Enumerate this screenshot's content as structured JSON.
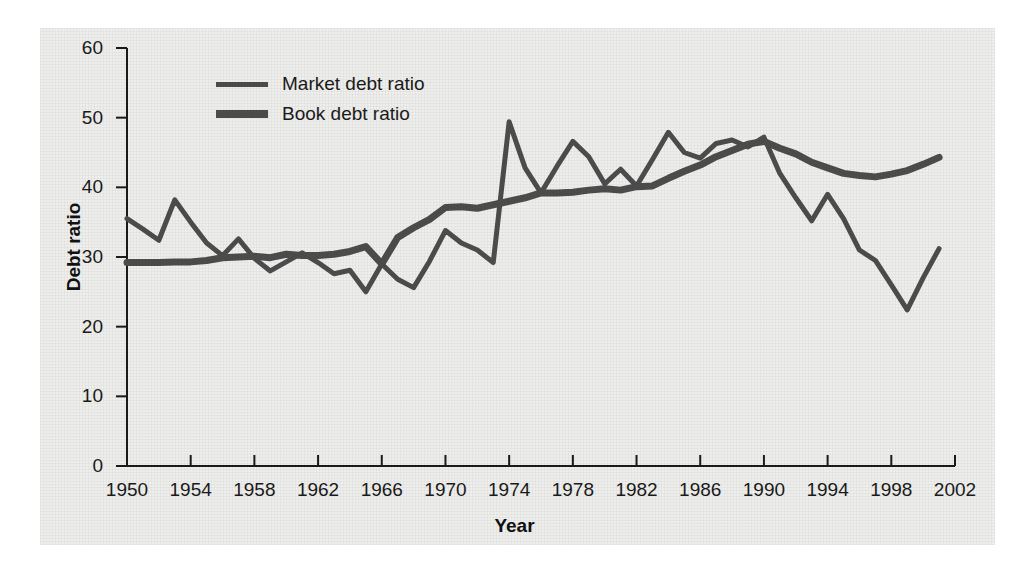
{
  "chart_data": {
    "type": "line",
    "title": "",
    "xlabel": "Year",
    "ylabel": "Debt ratio",
    "xlim": [
      1950,
      2002
    ],
    "ylim": [
      0,
      60
    ],
    "yticks": [
      0,
      10,
      20,
      30,
      40,
      50,
      60
    ],
    "xticks": [
      1950,
      1954,
      1958,
      1962,
      1966,
      1970,
      1974,
      1978,
      1982,
      1986,
      1990,
      1994,
      1998,
      2002
    ],
    "grid": false,
    "legend_position": "upper-left-inside",
    "line_color": "#4b4b4b",
    "panel_color": "#eeeeec",
    "x": [
      1950,
      1951,
      1952,
      1953,
      1954,
      1955,
      1956,
      1957,
      1958,
      1959,
      1960,
      1961,
      1962,
      1963,
      1964,
      1965,
      1966,
      1967,
      1968,
      1969,
      1970,
      1971,
      1972,
      1973,
      1974,
      1975,
      1976,
      1977,
      1978,
      1979,
      1980,
      1981,
      1982,
      1983,
      1984,
      1985,
      1986,
      1987,
      1988,
      1989,
      1990,
      1991,
      1992,
      1993,
      1994,
      1995,
      1996,
      1997,
      1998,
      1999,
      2000,
      2001
    ],
    "series": [
      {
        "name": "Market debt ratio",
        "style": "thin",
        "values": [
          35.5,
          34.0,
          32.4,
          38.2,
          35.0,
          32.0,
          30.2,
          32.6,
          29.8,
          28.0,
          29.3,
          30.6,
          29.2,
          27.6,
          28.1,
          25.0,
          29.0,
          26.8,
          25.6,
          29.4,
          33.8,
          32.0,
          31.0,
          29.2,
          49.4,
          42.8,
          39.2,
          43.0,
          46.6,
          44.4,
          40.5,
          42.6,
          40.2,
          44.0,
          47.9,
          45.0,
          44.2,
          46.3,
          46.8,
          45.8,
          47.2,
          42.0,
          38.5,
          35.2,
          39.0,
          35.5,
          31.0,
          29.5,
          26.0,
          22.4,
          27.0,
          31.2
        ]
      },
      {
        "name": "Book debt ratio",
        "style": "thick",
        "values": [
          29.2,
          29.2,
          29.2,
          29.3,
          29.3,
          29.5,
          29.9,
          30.0,
          30.1,
          29.9,
          30.4,
          30.2,
          30.2,
          30.4,
          30.8,
          31.5,
          29.0,
          32.8,
          34.2,
          35.4,
          37.1,
          37.2,
          37.0,
          37.5,
          38.0,
          38.5,
          39.2,
          39.2,
          39.3,
          39.6,
          39.8,
          39.6,
          40.1,
          40.2,
          41.3,
          42.3,
          43.2,
          44.4,
          45.3,
          46.2,
          46.6,
          45.6,
          44.8,
          43.6,
          42.8,
          42.0,
          41.7,
          41.5,
          41.9,
          42.4,
          43.3,
          44.3
        ]
      }
    ]
  },
  "axes": {
    "y_tick_labels": [
      "60",
      "50",
      "40",
      "30",
      "20",
      "10",
      "0"
    ],
    "x_tick_labels": [
      "1950",
      "1954",
      "1958",
      "1962",
      "1966",
      "1970",
      "1974",
      "1978",
      "1982",
      "1986",
      "1990",
      "1994",
      "1998",
      "2002"
    ],
    "y_axis_title": "Debt ratio",
    "x_axis_title": "Year"
  },
  "legend": {
    "items": [
      {
        "label": "Market debt ratio",
        "swatch": "market-line-swatch"
      },
      {
        "label": "Book debt ratio",
        "swatch": "book-line-swatch"
      }
    ]
  }
}
